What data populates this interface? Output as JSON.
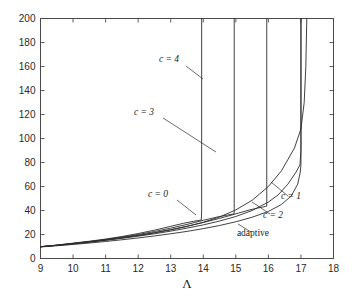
{
  "chart_data": {
    "type": "line",
    "title": "",
    "subtitle": "",
    "xlabel": "Λ",
    "ylabel": "",
    "xlim": [
      9,
      18
    ],
    "ylim": [
      0,
      200
    ],
    "xticks": [
      9,
      10,
      11,
      12,
      13,
      14,
      15,
      16,
      17,
      18
    ],
    "yticks": [
      0,
      20,
      40,
      60,
      80,
      100,
      120,
      140,
      160,
      180,
      200
    ],
    "xtick_labels": [
      "9",
      "10",
      "11",
      "12",
      "13",
      "14",
      "15",
      "16",
      "17",
      "18"
    ],
    "ytick_labels": [
      "0",
      "20",
      "40",
      "60",
      "80",
      "100",
      "120",
      "140",
      "160",
      "180",
      "200"
    ],
    "grid": false,
    "legend": "inline-annotations",
    "line_color": "#2b2b2b",
    "series": [
      {
        "name": "c = 0",
        "label": "c = 0",
        "asymptote_x": 13.95,
        "x": [
          9.0,
          9.5,
          10.0,
          10.5,
          11.0,
          11.5,
          12.0,
          12.5,
          13.0,
          13.4,
          13.7,
          13.88,
          13.94,
          13.95,
          13.95
        ],
        "y": [
          9.8,
          11.2,
          12.8,
          14.4,
          16.2,
          18.3,
          20.8,
          23.6,
          26.8,
          29.4,
          31.0,
          31.8,
          32.0,
          40.0,
          200.0
        ]
      },
      {
        "name": "c = 3",
        "label": "c = 3",
        "asymptote_x": 14.95,
        "x": [
          9.0,
          9.5,
          10.0,
          10.5,
          11.0,
          11.5,
          12.0,
          12.5,
          13.0,
          13.5,
          14.0,
          14.4,
          14.7,
          14.9,
          14.95,
          14.95
        ],
        "y": [
          9.8,
          11.1,
          12.6,
          14.1,
          15.8,
          17.8,
          20.0,
          22.5,
          25.3,
          28.4,
          31.8,
          34.4,
          36.0,
          37.0,
          37.4,
          200.0
        ]
      },
      {
        "name": "c = 4",
        "label": "c = 4",
        "asymptote_x": 15.95,
        "x": [
          9.0,
          9.5,
          10.0,
          10.5,
          11.0,
          11.5,
          12.0,
          12.5,
          13.0,
          13.5,
          14.0,
          14.5,
          15.0,
          15.4,
          15.7,
          15.9,
          15.95,
          15.95
        ],
        "y": [
          9.8,
          11.0,
          12.4,
          13.9,
          15.5,
          17.3,
          19.3,
          21.6,
          24.1,
          26.9,
          30.0,
          33.4,
          37.2,
          40.3,
          42.2,
          43.3,
          43.6,
          200.0
        ]
      },
      {
        "name": "c = 2",
        "label": "c = 2",
        "asymptote_x": 17.0,
        "x": [
          9.0,
          9.5,
          10.0,
          10.5,
          11.0,
          11.5,
          12.0,
          12.5,
          13.0,
          13.5,
          14.0,
          14.5,
          15.0,
          15.5,
          16.0,
          16.3,
          16.6,
          16.85,
          16.97,
          17.0,
          17.0
        ],
        "y": [
          9.8,
          10.9,
          12.2,
          13.6,
          15.1,
          16.8,
          18.6,
          20.6,
          22.8,
          25.3,
          28.0,
          31.2,
          35.0,
          40.0,
          47.0,
          53.0,
          62.0,
          72.0,
          78.0,
          90.0,
          200.0
        ]
      },
      {
        "name": "c = 1",
        "label": "c = 1",
        "asymptote_x": 17.18,
        "x": [
          9.0,
          9.5,
          10.0,
          10.5,
          11.0,
          11.5,
          12.0,
          12.5,
          13.0,
          13.5,
          14.0,
          14.5,
          15.0,
          15.5,
          16.0,
          16.4,
          16.8,
          17.0,
          17.1,
          17.15,
          17.18
        ],
        "y": [
          9.8,
          11.0,
          12.3,
          13.8,
          15.4,
          17.2,
          19.1,
          21.3,
          23.8,
          26.7,
          30.2,
          34.6,
          40.5,
          48.5,
          60.0,
          73.0,
          92.0,
          108.0,
          130.0,
          160.0,
          200.0
        ]
      },
      {
        "name": "adaptive",
        "label": "adaptive",
        "asymptote_x": 17.0,
        "x": [
          9.0,
          9.5,
          10.0,
          10.5,
          11.0,
          11.5,
          12.0,
          12.5,
          13.0,
          13.5,
          14.0,
          14.5,
          15.0,
          15.5,
          16.0,
          16.4,
          16.7,
          16.9,
          16.98,
          17.0,
          17.0
        ],
        "y": [
          9.6,
          10.6,
          11.7,
          12.9,
          14.2,
          15.6,
          17.1,
          18.8,
          20.6,
          22.6,
          24.9,
          27.5,
          30.6,
          34.4,
          39.2,
          45.0,
          52.0,
          62.0,
          72.0,
          78.0,
          200.0
        ]
      }
    ],
    "annotations": [
      {
        "text": "c = 4",
        "style": "italic-math",
        "text_x": 169,
        "text_y": 62,
        "leader": [
          [
            186,
            66
          ],
          [
            203,
            79
          ]
        ]
      },
      {
        "text": "c = 3",
        "style": "italic-math",
        "text_x": 144,
        "text_y": 115,
        "leader": [
          [
            163,
            118
          ],
          [
            216,
            152
          ]
        ]
      },
      {
        "text": "c = 0",
        "style": "italic-math",
        "text_x": 158,
        "text_y": 197,
        "leader": [
          [
            177,
            200
          ],
          [
            196,
            215
          ]
        ]
      },
      {
        "text": "c = 1",
        "style": "italic-math",
        "text_x": 291,
        "text_y": 199,
        "leader": [
          [
            288,
            196
          ],
          [
            271,
            182
          ]
        ]
      },
      {
        "text": "c = 2",
        "style": "italic-math",
        "text_x": 273,
        "text_y": 218,
        "leader": [
          [
            270,
            214
          ],
          [
            252,
            202
          ]
        ]
      },
      {
        "text": "adaptive",
        "style": "plain",
        "text_x": 253,
        "text_y": 236,
        "leader": [
          [
            251,
            232
          ],
          [
            238,
            224
          ]
        ]
      }
    ]
  },
  "figure": {
    "background_color": "#ffffff",
    "axis_color": "#4a4a4a",
    "curve_color": "#2b2b2b"
  }
}
